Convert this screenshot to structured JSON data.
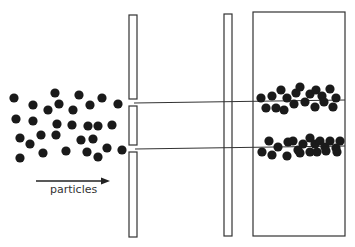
{
  "diagram": {
    "arrow_label": "particles",
    "colors": {
      "ink": "#1a1a1a",
      "stroke": "#333333",
      "background": "#ffffff"
    },
    "source_particles": [
      [
        14,
        98
      ],
      [
        55,
        93
      ],
      [
        79,
        95
      ],
      [
        102,
        98
      ],
      [
        118,
        104
      ],
      [
        33,
        105
      ],
      [
        48,
        110
      ],
      [
        59,
        104
      ],
      [
        73,
        110
      ],
      [
        90,
        105
      ],
      [
        16,
        119
      ],
      [
        33,
        121
      ],
      [
        57,
        124
      ],
      [
        72,
        125
      ],
      [
        88,
        126
      ],
      [
        98,
        126
      ],
      [
        112,
        125
      ],
      [
        20,
        138
      ],
      [
        30,
        144
      ],
      [
        41,
        135
      ],
      [
        56,
        135
      ],
      [
        81,
        140
      ],
      [
        93,
        139
      ],
      [
        20,
        158
      ],
      [
        43,
        153
      ],
      [
        66,
        151
      ],
      [
        87,
        152
      ],
      [
        107,
        148
      ],
      [
        98,
        157
      ],
      [
        122,
        150
      ]
    ],
    "slit_barrier": {
      "x": 129,
      "width": 8,
      "segments": [
        [
          15,
          99
        ],
        [
          106,
          145
        ],
        [
          152,
          237
        ]
      ]
    },
    "second_barrier": {
      "x": 224,
      "width": 8,
      "top": 14,
      "bottom": 236
    },
    "screen": {
      "x": 253,
      "y": 12,
      "width": 92,
      "height": 224
    },
    "beam_lines": [
      {
        "x1": 134,
        "y1": 103,
        "x2": 345,
        "y2": 100
      },
      {
        "x1": 135,
        "y1": 149,
        "x2": 345,
        "y2": 146
      }
    ],
    "upper_band_particles": [
      [
        261,
        98
      ],
      [
        272,
        96
      ],
      [
        281,
        90
      ],
      [
        287,
        98
      ],
      [
        296,
        93
      ],
      [
        300,
        87
      ],
      [
        310,
        94
      ],
      [
        316,
        90
      ],
      [
        322,
        96
      ],
      [
        330,
        89
      ],
      [
        336,
        98
      ],
      [
        266,
        108
      ],
      [
        276,
        108
      ],
      [
        284,
        110
      ],
      [
        294,
        104
      ],
      [
        305,
        102
      ],
      [
        315,
        107
      ],
      [
        324,
        102
      ],
      [
        333,
        107
      ]
    ],
    "lower_band_particles": [
      [
        269,
        141
      ],
      [
        278,
        147
      ],
      [
        288,
        142
      ],
      [
        293,
        141
      ],
      [
        298,
        150
      ],
      [
        303,
        144
      ],
      [
        310,
        138
      ],
      [
        315,
        144
      ],
      [
        320,
        141
      ],
      [
        325,
        147
      ],
      [
        330,
        141
      ],
      [
        336,
        148
      ],
      [
        340,
        141
      ],
      [
        262,
        152
      ],
      [
        272,
        155
      ],
      [
        287,
        156
      ],
      [
        300,
        153
      ],
      [
        310,
        152
      ],
      [
        317,
        152
      ],
      [
        326,
        151
      ],
      [
        337,
        152
      ]
    ],
    "arrow": {
      "x1": 36,
      "y1": 181,
      "x2": 110,
      "y2": 181
    }
  }
}
